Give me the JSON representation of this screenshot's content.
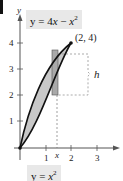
{
  "figure": {
    "upper_curve": {
      "equation": "y = 4x − x²",
      "label_prefix": "y = 4",
      "label_var": "x",
      "label_mid": " − ",
      "label_var2": "x",
      "label_sup": "2"
    },
    "lower_curve": {
      "equation": "y = x²",
      "label_prefix": "y = ",
      "label_var": "x",
      "label_sup": "2"
    },
    "point_label": "(2, 4)",
    "height_label": "h",
    "strip_x_label": "x",
    "y_axis_label": "y",
    "y_ticks": [
      "1",
      "2",
      "3",
      "4"
    ],
    "x_ticks": [
      "1",
      "2",
      "3"
    ],
    "colors": {
      "fill": "#c8c8c8",
      "strip": "#a9a9a9",
      "curve": "#111111",
      "label_bg": "#e8e8e8"
    }
  }
}
